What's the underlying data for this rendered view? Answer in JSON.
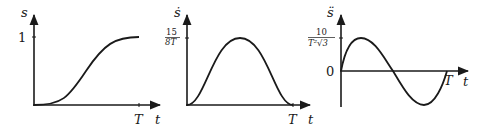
{
  "figure": {
    "panels": [
      {
        "id": "position",
        "y_label": "s",
        "x_label": "t",
        "y_tick": "1",
        "x_tick": "T",
        "curve": "sigmoid from 0 to 1"
      },
      {
        "id": "velocity",
        "y_label": "ṡ",
        "x_label": "t",
        "y_tick_num": "15",
        "y_tick_den": "8T",
        "x_tick": "T",
        "curve": "bell shape peaking at t = T/2"
      },
      {
        "id": "acceleration",
        "y_label": "s̈",
        "x_label": "t",
        "y_tick_num": "10",
        "y_tick_den": "T²√3",
        "y_zero": "0",
        "x_tick": "T",
        "curve": "one sine-like period, positive then negative"
      }
    ]
  },
  "colors": {
    "stroke": "#1a1a1a",
    "background": "#ffffff"
  }
}
